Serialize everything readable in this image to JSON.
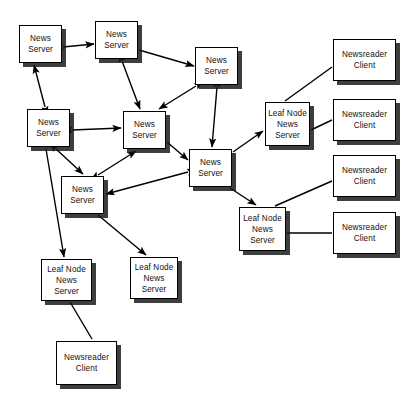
{
  "diagram": {
    "background_color": "#ffffff",
    "node_fill": "#ffffff",
    "node_border": "#000000",
    "shadow_color": "#141414",
    "edge_color": "#000000",
    "labels": {
      "news_server": "News\nServer",
      "leaf_node_news_server": "Leaf Node\nNews\nServer",
      "newsreader_client": "Newsreader\nClient"
    },
    "nodes": [
      {
        "id": "ns1",
        "name": "news-server-top-left",
        "type": "news-server",
        "label": "News\nServer",
        "x": 19,
        "y": 25,
        "w": 43,
        "h": 38
      },
      {
        "id": "ns2",
        "name": "news-server-top-middle",
        "type": "news-server",
        "label": "News\nServer",
        "x": 95,
        "y": 21,
        "w": 43,
        "h": 38
      },
      {
        "id": "ns3",
        "name": "news-server-top-right",
        "type": "news-server",
        "label": "News\nServer",
        "x": 195,
        "y": 47,
        "w": 43,
        "h": 38
      },
      {
        "id": "ns4",
        "name": "news-server-left",
        "type": "news-server",
        "label": "News\nServer",
        "x": 27,
        "y": 109,
        "w": 43,
        "h": 38
      },
      {
        "id": "ns5",
        "name": "news-server-center",
        "type": "news-server",
        "label": "News\nServer",
        "x": 123,
        "y": 111,
        "w": 43,
        "h": 38
      },
      {
        "id": "ns6",
        "name": "news-server-right",
        "type": "news-server",
        "label": "News\nServer",
        "x": 189,
        "y": 149,
        "w": 43,
        "h": 38
      },
      {
        "id": "ns7",
        "name": "news-server-lower-left",
        "type": "news-server",
        "label": "News\nServer",
        "x": 61,
        "y": 176,
        "w": 43,
        "h": 38
      },
      {
        "id": "ln1",
        "name": "leaf-node-news-server-top-right",
        "type": "leaf-node",
        "label": "Leaf Node\nNews\nServer",
        "x": 265,
        "y": 102,
        "w": 45,
        "h": 44
      },
      {
        "id": "ln2",
        "name": "leaf-node-news-server-bottom-right",
        "type": "leaf-node",
        "label": "Leaf Node\nNews\nServer",
        "x": 239,
        "y": 207,
        "w": 47,
        "h": 44
      },
      {
        "id": "ln3",
        "name": "leaf-node-news-server-bottom-left",
        "type": "leaf-node",
        "label": "Leaf Node\nNews\nServer",
        "x": 41,
        "y": 259,
        "w": 51,
        "h": 42
      },
      {
        "id": "ln4",
        "name": "leaf-node-news-server-bottom-middle",
        "type": "leaf-node",
        "label": "Leaf Node\nNews\nServer",
        "x": 130,
        "y": 257,
        "w": 48,
        "h": 42
      },
      {
        "id": "nc1",
        "name": "newsreader-client-1",
        "type": "client",
        "label": "Newsreader\nClient",
        "x": 333,
        "y": 39,
        "w": 63,
        "h": 42
      },
      {
        "id": "nc2",
        "name": "newsreader-client-2",
        "type": "client",
        "label": "Newsreader\nClient",
        "x": 333,
        "y": 99,
        "w": 63,
        "h": 42
      },
      {
        "id": "nc3",
        "name": "newsreader-client-3",
        "type": "client",
        "label": "Newsreader\nClient",
        "x": 333,
        "y": 155,
        "w": 63,
        "h": 42
      },
      {
        "id": "nc4",
        "name": "newsreader-client-4",
        "type": "client",
        "label": "Newsreader\nClient",
        "x": 333,
        "y": 212,
        "w": 63,
        "h": 42
      },
      {
        "id": "nc5",
        "name": "newsreader-client-bottom",
        "type": "client",
        "label": "Newsreader\nClient",
        "x": 56,
        "y": 341,
        "w": 61,
        "h": 44
      }
    ],
    "edges": [
      {
        "name": "edge-ns1-ns2",
        "from": "ns1",
        "to": "ns2",
        "arrows": "both",
        "x1": 63,
        "y1": 47,
        "x2": 94,
        "y2": 44
      },
      {
        "name": "edge-ns1-ns4",
        "from": "ns4",
        "to": "ns1",
        "arrows": "both",
        "x1": 45,
        "y1": 107,
        "x2": 34,
        "y2": 65
      },
      {
        "name": "edge-ns2-ns3",
        "from": "ns2",
        "to": "ns3",
        "arrows": "single",
        "x1": 139,
        "y1": 50,
        "x2": 194,
        "y2": 66
      },
      {
        "name": "edge-ns2-ns5",
        "from": "ns2",
        "to": "ns5",
        "arrows": "both",
        "x1": 122,
        "y1": 61,
        "x2": 140,
        "y2": 109
      },
      {
        "name": "edge-ns3-ns5",
        "from": "ns3",
        "to": "ns5",
        "arrows": "both",
        "x1": 196,
        "y1": 86,
        "x2": 159,
        "y2": 109
      },
      {
        "name": "edge-ns3-ns6",
        "from": "ns3",
        "to": "ns6",
        "arrows": "both",
        "x1": 217,
        "y1": 87,
        "x2": 212,
        "y2": 147
      },
      {
        "name": "edge-ns4-ns5",
        "from": "ns4",
        "to": "ns5",
        "arrows": "both",
        "x1": 72,
        "y1": 130,
        "x2": 121,
        "y2": 128
      },
      {
        "name": "edge-ns4-ns7",
        "from": "ns4",
        "to": "ns7",
        "arrows": "both",
        "x1": 56,
        "y1": 149,
        "x2": 83,
        "y2": 174
      },
      {
        "name": "edge-ns5-ns7",
        "from": "ns7",
        "to": "ns5",
        "arrows": "both",
        "x1": 98,
        "y1": 175,
        "x2": 136,
        "y2": 151
      },
      {
        "name": "edge-ns5-ns6",
        "from": "ns5",
        "to": "ns6",
        "arrows": "single",
        "x1": 167,
        "y1": 142,
        "x2": 188,
        "y2": 160
      },
      {
        "name": "edge-ns6-ns7",
        "from": "ns6",
        "to": "ns7",
        "arrows": "both",
        "x1": 188,
        "y1": 172,
        "x2": 106,
        "y2": 194
      },
      {
        "name": "edge-ns4-ln3",
        "from": "ns4",
        "to": "ln3",
        "arrows": "single",
        "x1": 46,
        "y1": 149,
        "x2": 64,
        "y2": 257
      },
      {
        "name": "edge-ns7-ln4",
        "from": "ns7",
        "to": "ln4",
        "arrows": "single",
        "x1": 98,
        "y1": 215,
        "x2": 146,
        "y2": 255
      },
      {
        "name": "edge-ns6-ln1",
        "from": "ns6",
        "to": "ln1",
        "arrows": "single",
        "x1": 233,
        "y1": 152,
        "x2": 263,
        "y2": 131
      },
      {
        "name": "edge-ns6-ln2",
        "from": "ns6",
        "to": "ln2",
        "arrows": "single",
        "x1": 230,
        "y1": 188,
        "x2": 256,
        "y2": 205
      },
      {
        "name": "edge-ln1-nc1",
        "from": "ln1",
        "to": "nc1",
        "arrows": "none",
        "x1": 285,
        "y1": 101,
        "x2": 332,
        "y2": 67
      },
      {
        "name": "edge-ln1-nc2",
        "from": "ln1",
        "to": "nc2",
        "arrows": "none",
        "x1": 311,
        "y1": 130,
        "x2": 332,
        "y2": 120
      },
      {
        "name": "edge-ln2-nc3",
        "from": "ln2",
        "to": "nc3",
        "arrows": "none",
        "x1": 275,
        "y1": 206,
        "x2": 332,
        "y2": 181
      },
      {
        "name": "edge-ln2-nc4",
        "from": "ln2",
        "to": "nc4",
        "arrows": "none",
        "x1": 287,
        "y1": 233,
        "x2": 332,
        "y2": 233
      },
      {
        "name": "edge-ln3-nc5",
        "from": "ln3",
        "to": "nc5",
        "arrows": "none",
        "x1": 70,
        "y1": 302,
        "x2": 92,
        "y2": 339
      }
    ]
  }
}
